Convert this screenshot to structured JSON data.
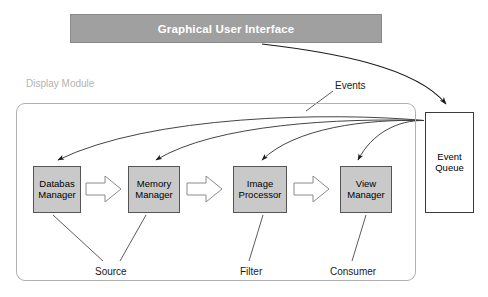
{
  "diagram": {
    "banner": {
      "label": "Graphical User Interface",
      "fill": "#a0a0a0",
      "text_color": "#ffffff"
    },
    "module": {
      "label": "Display Module",
      "label_color": "#b3b3b3",
      "border_color": "#b0b0b0"
    },
    "nodes": [
      {
        "id": "database-manager",
        "line1": "Databas",
        "line2": "Manager",
        "fill": "#c9c9c9"
      },
      {
        "id": "memory-manager",
        "line1": "Memory",
        "line2": "Manager",
        "fill": "#c9c9c9"
      },
      {
        "id": "image-processor",
        "line1": "Image",
        "line2": "Processor",
        "fill": "#c9c9c9"
      },
      {
        "id": "view-manager",
        "line1": "View",
        "line2": "Manager",
        "fill": "#c9c9c9"
      }
    ],
    "event_queue": {
      "line1": "Event",
      "line2": "Queue",
      "fill": "#ffffff",
      "border": "#3a3a3a"
    },
    "annotations": {
      "events": "Events",
      "source": "Source",
      "filter": "Filter",
      "consumer": "Consumer"
    },
    "flow_arrows": [
      {
        "from": "database-manager",
        "to": "memory-manager",
        "style": "block-arrow"
      },
      {
        "from": "memory-manager",
        "to": "image-processor",
        "style": "block-arrow"
      },
      {
        "from": "image-processor",
        "to": "view-manager",
        "style": "block-arrow"
      }
    ],
    "event_arrows": [
      {
        "from": "graphical-user-interface",
        "to": "event-queue",
        "style": "curved"
      },
      {
        "from": "event-queue",
        "to": "database-manager",
        "style": "curved"
      },
      {
        "from": "event-queue",
        "to": "memory-manager",
        "style": "curved"
      },
      {
        "from": "event-queue",
        "to": "image-processor",
        "style": "curved"
      },
      {
        "from": "event-queue",
        "to": "view-manager",
        "style": "curved"
      }
    ],
    "role_leaders": [
      {
        "label": "Source",
        "nodes": [
          "database-manager",
          "memory-manager"
        ]
      },
      {
        "label": "Filter",
        "nodes": [
          "image-processor"
        ]
      },
      {
        "label": "Consumer",
        "nodes": [
          "view-manager"
        ]
      }
    ]
  }
}
